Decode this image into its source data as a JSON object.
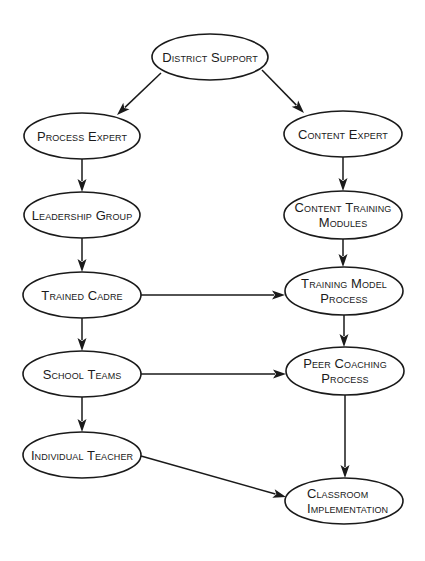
{
  "diagram": {
    "type": "flowchart",
    "colors": {
      "background": "#ffffff",
      "stroke": "#1a1a1a",
      "text": "#1a1a1a"
    },
    "nodes": [
      {
        "id": "district_support",
        "lines": [
          "District Support"
        ],
        "cx": 210,
        "cy": 57,
        "rx": 58,
        "ry": 23,
        "align": "center"
      },
      {
        "id": "process_expert",
        "lines": [
          "Process Expert"
        ],
        "cx": 82,
        "cy": 136,
        "rx": 58,
        "ry": 23,
        "align": "center"
      },
      {
        "id": "content_expert",
        "lines": [
          "Content Expert"
        ],
        "cx": 343,
        "cy": 134,
        "rx": 59,
        "ry": 23,
        "align": "center"
      },
      {
        "id": "leadership_group",
        "lines": [
          "Leadership Group"
        ],
        "cx": 82,
        "cy": 215,
        "rx": 58,
        "ry": 23,
        "align": "center"
      },
      {
        "id": "content_training_modules",
        "lines": [
          "Content Training",
          "Modules"
        ],
        "cx": 343,
        "cy": 215,
        "rx": 59,
        "ry": 24,
        "align": "center"
      },
      {
        "id": "trained_cadre",
        "lines": [
          "Trained Cadre"
        ],
        "cx": 82,
        "cy": 295,
        "rx": 59,
        "ry": 23,
        "align": "center"
      },
      {
        "id": "training_model_process",
        "lines": [
          "Training Model",
          "Process"
        ],
        "cx": 344,
        "cy": 291,
        "rx": 59,
        "ry": 24,
        "align": "center"
      },
      {
        "id": "school_teams",
        "lines": [
          "School Teams"
        ],
        "cx": 82,
        "cy": 374,
        "rx": 59,
        "ry": 23,
        "align": "center"
      },
      {
        "id": "peer_coaching_process",
        "lines": [
          "Peer Coaching",
          "Process"
        ],
        "cx": 345,
        "cy": 371,
        "rx": 59,
        "ry": 24,
        "align": "center"
      },
      {
        "id": "individual_teacher",
        "lines": [
          "Individual Teacher"
        ],
        "cx": 82,
        "cy": 455,
        "rx": 59,
        "ry": 23,
        "align": "center"
      },
      {
        "id": "classroom_implementation",
        "lines": [
          "Classroom",
          "Implementation"
        ],
        "cx": 344,
        "cy": 501,
        "rx": 59,
        "ry": 23,
        "align": "left"
      }
    ],
    "edges": [
      {
        "from": "district_support",
        "to": "process_expert",
        "x1": 161,
        "y1": 73,
        "x2": 117,
        "y2": 115
      },
      {
        "from": "district_support",
        "to": "content_expert",
        "x1": 262,
        "y1": 70,
        "x2": 304,
        "y2": 113
      },
      {
        "from": "process_expert",
        "to": "leadership_group",
        "x1": 82,
        "y1": 159,
        "x2": 82,
        "y2": 192
      },
      {
        "from": "content_expert",
        "to": "content_training_modules",
        "x1": 343,
        "y1": 157,
        "x2": 343,
        "y2": 191
      },
      {
        "from": "leadership_group",
        "to": "trained_cadre",
        "x1": 82,
        "y1": 238,
        "x2": 82,
        "y2": 272
      },
      {
        "from": "content_training_modules",
        "to": "training_model_process",
        "x1": 343,
        "y1": 239,
        "x2": 343,
        "y2": 267
      },
      {
        "from": "trained_cadre",
        "to": "training_model_process",
        "x1": 141,
        "y1": 295,
        "x2": 285,
        "y2": 295
      },
      {
        "from": "trained_cadre",
        "to": "school_teams",
        "x1": 82,
        "y1": 318,
        "x2": 82,
        "y2": 351
      },
      {
        "from": "training_model_process",
        "to": "peer_coaching_process",
        "x1": 344,
        "y1": 315,
        "x2": 344,
        "y2": 347
      },
      {
        "from": "school_teams",
        "to": "peer_coaching_process",
        "x1": 141,
        "y1": 374,
        "x2": 286,
        "y2": 374
      },
      {
        "from": "school_teams",
        "to": "individual_teacher",
        "x1": 82,
        "y1": 397,
        "x2": 82,
        "y2": 432
      },
      {
        "from": "peer_coaching_process",
        "to": "classroom_implementation",
        "x1": 345,
        "y1": 395,
        "x2": 345,
        "y2": 478
      },
      {
        "from": "individual_teacher",
        "to": "classroom_implementation",
        "x1": 141,
        "y1": 456,
        "x2": 286,
        "y2": 497
      }
    ]
  }
}
